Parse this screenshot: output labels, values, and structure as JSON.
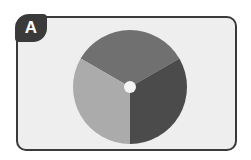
{
  "badge": {
    "label": "A"
  },
  "disc": {
    "center": [
      60,
      57
    ],
    "radius": 57,
    "hole_radius": 6,
    "segments": [
      {
        "name": "top",
        "color": "#707070",
        "start_deg": -150,
        "end_deg": -30
      },
      {
        "name": "right",
        "color": "#4b4b4b",
        "start_deg": -30,
        "end_deg": 90
      },
      {
        "name": "left",
        "color": "#ababab",
        "start_deg": 90,
        "end_deg": 210
      }
    ],
    "hole_color": "#f4f4f4"
  },
  "colors": {
    "card_bg": "#eeeeee",
    "border": "#3a3a3a"
  }
}
